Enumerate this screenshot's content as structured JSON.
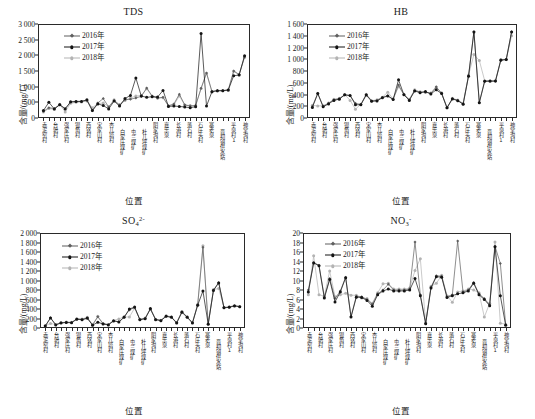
{
  "figure": {
    "axis_label_x": "位置",
    "axis_label_y": "含量/(mg/L)",
    "legend": [
      {
        "label": "2016年",
        "color": "#5f5f5f",
        "marker": "diamond"
      },
      {
        "label": "2017年",
        "color": "#141414",
        "marker": "circle"
      },
      {
        "label": "2018年",
        "color": "#b3b3b3",
        "marker": "circle"
      }
    ],
    "categories": [
      "赤泥窑村",
      "台骀村",
      "强家庄村",
      "银角村",
      "西铭村",
      "宋家山村",
      "杏儿塔村",
      "白家庄煤矿",
      "屯兰煤矿",
      "杜儿坪煤矿",
      "阴家沟村",
      "嘉乐泉",
      "长港村",
      "落石村",
      "石庄头村",
      "寨老泉",
      "晋祠镇供水站",
      "平泉村1",
      "神堂沟村"
    ],
    "categories_full": [
      "赤泥窑村",
      "台骀村",
      "强家庄村",
      "银角村",
      "西铭村",
      "宋家山村",
      "杏儿塔村",
      "白家庄煤矿",
      "屯兰煤矿",
      "杜儿坪煤矿",
      "阴家沟村",
      "嘉乐泉",
      "长港村",
      "落石村",
      "石庄头村",
      "寨老泉",
      "晋祠镇供水站",
      "平泉村1",
      "神堂沟村"
    ]
  },
  "chart_data": [
    {
      "type": "line",
      "panel": "tds",
      "title": "TDS",
      "title_html": "TDS",
      "xlabel": "位置",
      "ylabel": "含量/(mg/L)",
      "ylim": [
        0,
        3000
      ],
      "ytick_step": 500,
      "yticks": [
        "0",
        "500",
        "1 000",
        "1 500",
        "2 000",
        "2 500",
        "3 000"
      ],
      "grid": false,
      "legend_position": "upper-left-inset",
      "categories": [
        "赤泥窑村",
        "台骀村",
        "强家庄村",
        "银角村",
        "西铭村",
        "宋家山村",
        "杏儿塔村",
        "白家庄煤矿",
        "屯兰煤矿",
        "杜儿坪煤矿",
        "阴家沟村",
        "嘉乐泉",
        "长港村",
        "落石村",
        "石庄头村",
        "寨老泉",
        "晋祠镇供水站",
        "平泉村1",
        "神堂沟村"
      ],
      "n_points": 38,
      "series": [
        {
          "name": "2016年",
          "color": "#5f5f5f",
          "values": [
            210,
            330,
            300,
            430,
            300,
            500,
            520,
            530,
            560,
            230,
            480,
            620,
            350,
            560,
            420,
            580,
            600,
            640,
            690,
            960,
            700,
            640,
            660,
            390,
            450,
            760,
            420,
            380,
            400,
            950,
            1440,
            850,
            880,
            880,
            900,
            1500,
            1390,
            1950
          ]
        },
        {
          "name": "2017年",
          "color": "#141414",
          "values": [
            240,
            500,
            290,
            420,
            290,
            520,
            530,
            530,
            580,
            240,
            450,
            400,
            290,
            540,
            380,
            620,
            720,
            1280,
            700,
            660,
            680,
            670,
            880,
            370,
            380,
            370,
            350,
            330,
            360,
            2700,
            380,
            840,
            870,
            870,
            890,
            1350,
            1370,
            1990
          ]
        },
        {
          "name": "2018年",
          "color": "#b3b3b3",
          "values": [
            190,
            300,
            280,
            440,
            195,
            470,
            500,
            510,
            540,
            330,
            460,
            480,
            360,
            580,
            400,
            560,
            640,
            700,
            720,
            930,
            690,
            630,
            650,
            380,
            420,
            700,
            410,
            400,
            390,
            940,
            1420,
            830,
            860,
            870,
            880,
            1490,
            1380,
            1930
          ]
        }
      ]
    },
    {
      "type": "line",
      "panel": "hb",
      "title": "HB",
      "title_html": "HB",
      "xlabel": "位置",
      "ylabel": "含量/(mg/L)",
      "ylim": [
        0,
        1600
      ],
      "ytick_step": 200,
      "yticks": [
        "0",
        "200",
        "400",
        "600",
        "800",
        "1 000",
        "1 200",
        "1 400",
        "1 600"
      ],
      "grid": false,
      "legend_position": "upper-left-inset",
      "categories": [
        "赤泥窑村",
        "台骀村",
        "强家庄村",
        "银角村",
        "西铭村",
        "宋家山村",
        "杏儿塔村",
        "白家庄煤矿",
        "屯兰煤矿",
        "杜儿坪煤矿",
        "阴家沟村",
        "嘉乐泉",
        "长港村",
        "落石村",
        "石庄头村",
        "寨老泉",
        "晋祠镇供水站",
        "平泉村1",
        "神堂沟村"
      ],
      "n_points": 38,
      "series": [
        {
          "name": "2016年",
          "color": "#5f5f5f",
          "values": [
            200,
            420,
            200,
            250,
            310,
            330,
            390,
            380,
            250,
            230,
            400,
            290,
            300,
            350,
            380,
            320,
            560,
            400,
            310,
            470,
            440,
            440,
            420,
            530,
            420,
            170,
            330,
            300,
            240,
            720,
            1470,
            265,
            630,
            630,
            625,
            990,
            990,
            1470
          ]
        },
        {
          "name": "2017年",
          "color": "#141414",
          "values": [
            180,
            415,
            190,
            240,
            300,
            320,
            395,
            385,
            225,
            225,
            390,
            285,
            290,
            345,
            375,
            315,
            650,
            395,
            300,
            460,
            430,
            450,
            410,
            480,
            415,
            175,
            325,
            295,
            235,
            710,
            1465,
            260,
            625,
            628,
            630,
            985,
            995,
            1465
          ]
        },
        {
          "name": "2018年",
          "color": "#b3b3b3",
          "values": [
            215,
            205,
            210,
            255,
            320,
            335,
            400,
            300,
            150,
            235,
            405,
            295,
            310,
            355,
            440,
            325,
            530,
            405,
            320,
            480,
            445,
            435,
            425,
            520,
            430,
            180,
            335,
            305,
            250,
            730,
            1080,
            980,
            635,
            620,
            635,
            995,
            1000,
            1400
          ]
        }
      ]
    },
    {
      "type": "line",
      "panel": "so4",
      "title": "SO4 2-",
      "title_html": "SO<sub>4</sub><sup>2-</sup>",
      "xlabel": "位置",
      "ylabel": "含量/(mg/L)",
      "ylim": [
        0,
        2000
      ],
      "ytick_step": 200,
      "yticks": [
        "0",
        "200",
        "400",
        "600",
        "800",
        "1 000",
        "1 200",
        "1 400",
        "1 600",
        "1 800",
        "2 000"
      ],
      "grid": false,
      "legend_position": "upper-left-inset",
      "categories": [
        "赤泥窑村",
        "台骀村",
        "强家庄村",
        "银角村",
        "西铭村",
        "宋家山村",
        "杏儿塔村",
        "白家庄煤矿",
        "屯兰煤矿",
        "杜儿坪煤矿",
        "阴家沟村",
        "嘉乐泉",
        "长港村",
        "落石村",
        "石庄头村",
        "寨老泉",
        "晋祠镇供水站",
        "平泉村1",
        "神堂沟村"
      ],
      "n_points": 38,
      "series": [
        {
          "name": "2016年",
          "color": "#5f5f5f",
          "values": [
            45,
            215,
            70,
            110,
            120,
            115,
            190,
            180,
            200,
            65,
            235,
            90,
            70,
            155,
            130,
            230,
            380,
            430,
            180,
            200,
            400,
            180,
            160,
            250,
            230,
            110,
            340,
            230,
            110,
            490,
            1700,
            85,
            800,
            960,
            430,
            440,
            470,
            450,
            780,
            880,
            1320
          ]
        },
        {
          "name": "2017年",
          "color": "#141414",
          "values": [
            40,
            210,
            65,
            105,
            115,
            110,
            185,
            175,
            210,
            60,
            120,
            85,
            65,
            150,
            125,
            225,
            400,
            440,
            175,
            195,
            410,
            175,
            155,
            245,
            225,
            105,
            330,
            225,
            105,
            480,
            780,
            80,
            790,
            950,
            425,
            435,
            465,
            445,
            770,
            870,
            1330
          ]
        },
        {
          "name": "2018年",
          "color": "#b3b3b3",
          "values": [
            50,
            95,
            75,
            115,
            125,
            120,
            195,
            190,
            225,
            70,
            245,
            95,
            75,
            160,
            190,
            235,
            230,
            420,
            185,
            210,
            390,
            185,
            165,
            260,
            235,
            115,
            350,
            235,
            115,
            500,
            1730,
            90,
            810,
            830,
            435,
            445,
            475,
            455,
            790,
            890,
            1200
          ]
        }
      ]
    },
    {
      "type": "line",
      "panel": "no3",
      "title": "NO3 -",
      "title_html": "NO<sub>3</sub><sup>-</sup>",
      "xlabel": "位置",
      "ylabel": "含量/(mg/L)",
      "ylim": [
        0,
        20
      ],
      "ytick_step": 2,
      "yticks": [
        "0",
        "2",
        "4",
        "6",
        "8",
        "10",
        "12",
        "14",
        "16",
        "18",
        "20"
      ],
      "grid": false,
      "legend_position": "upper-left-inset",
      "categories": [
        "赤泥窑村",
        "台骀村",
        "强家庄村",
        "银角村",
        "西铭村",
        "宋家山村",
        "杏儿塔村",
        "白家庄煤矿",
        "屯兰煤矿",
        "杜儿坪煤矿",
        "阴家沟村",
        "嘉乐泉",
        "长港村",
        "落石村",
        "石庄头村",
        "寨老泉",
        "晋祠镇供水站",
        "平泉村1",
        "神堂沟村"
      ],
      "n_points": 38,
      "series": [
        {
          "name": "2016年",
          "color": "#5f5f5f",
          "values": [
            8.0,
            13.8,
            13.2,
            6.5,
            10.4,
            6.2,
            7.8,
            10.7,
            2.4,
            6.7,
            6.6,
            6.0,
            5.0,
            7.2,
            8.0,
            9.2,
            8.0,
            8.0,
            8.0,
            8.2,
            18.1,
            7.0,
            1.0,
            8.6,
            11.0,
            10.9,
            6.6,
            7.0,
            18.3,
            7.6,
            8.0,
            9.6,
            7.2,
            6.2,
            4.9,
            17.2,
            13.6,
            0.7,
            4.6,
            5.0,
            5.0,
            5.6,
            1.0,
            0.9,
            1.0,
            1.8
          ]
        },
        {
          "name": "2017年",
          "color": "#141414",
          "values": [
            7.6,
            13.7,
            13.1,
            6.3,
            10.2,
            5.5,
            7.6,
            10.6,
            2.3,
            6.5,
            6.4,
            5.8,
            4.6,
            7.0,
            7.8,
            8.2,
            7.8,
            7.8,
            7.8,
            8.0,
            10.4,
            6.8,
            0.9,
            8.4,
            10.8,
            10.7,
            6.4,
            6.8,
            7.2,
            7.4,
            7.8,
            9.4,
            7.0,
            6.0,
            4.7,
            17.1,
            6.8,
            0.6,
            4.4,
            4.8,
            4.8,
            5.5,
            0.8,
            0.8,
            1.0,
            1.7
          ]
        },
        {
          "name": "2018年",
          "color": "#b3b3b3",
          "values": [
            7.0,
            15.2,
            7.0,
            6.7,
            12.0,
            6.6,
            7.0,
            7.3,
            6.9,
            6.9,
            6.3,
            6.2,
            5.2,
            7.4,
            9.3,
            9.4,
            8.2,
            8.2,
            8.2,
            8.4,
            12.1,
            14.6,
            1.1,
            8.8,
            9.4,
            11.1,
            6.8,
            5.4,
            7.6,
            7.8,
            8.2,
            8.0,
            7.4,
            2.3,
            5.2,
            18.1,
            1.0,
            0.8,
            4.7,
            5.1,
            5.1,
            1.2,
            1.0,
            1.0,
            1.2,
            1.6
          ]
        }
      ]
    }
  ]
}
